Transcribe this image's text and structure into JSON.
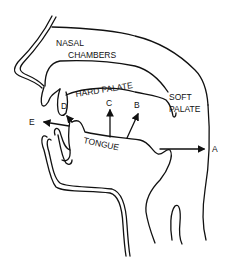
{
  "diagram": {
    "labels": {
      "nasal_line1": "NASAL",
      "nasal_line2": "CHAMBERS",
      "hard_palate": "HARD PALATE",
      "soft_line1": "SOFT",
      "soft_line2": "PALATE",
      "tongue": "TONGUE",
      "a": "A",
      "b": "B",
      "c": "C",
      "d": "D",
      "e": "E"
    },
    "colors": {
      "line": "#111111",
      "background": "#ffffff"
    }
  }
}
